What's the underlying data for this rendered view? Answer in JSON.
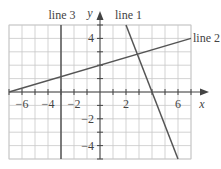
{
  "chart_data": {
    "type": "line",
    "title": "",
    "xlabel": "x",
    "ylabel": "y",
    "xlim": [
      -7,
      7
    ],
    "ylim": [
      -5,
      5
    ],
    "grid": true,
    "grid_step": 1,
    "x_tick_labels": [
      "-6",
      "-4",
      "-2",
      "2",
      "6"
    ],
    "x_tick_values": [
      -6,
      -4,
      -2,
      2,
      6
    ],
    "y_tick_labels": [
      "4",
      "-2",
      "-4"
    ],
    "y_tick_values": [
      4,
      -2,
      -4
    ],
    "series": [
      {
        "name": "line 1",
        "equation": "y = -2.5x + 10",
        "points": [
          [
            2,
            5
          ],
          [
            6,
            -5
          ]
        ]
      },
      {
        "name": "line 2",
        "equation": "y = (2/7)x + 2",
        "points": [
          [
            -7,
            0
          ],
          [
            7,
            4
          ]
        ]
      },
      {
        "name": "line 3",
        "equation": "x = -3",
        "points": [
          [
            -3,
            5
          ],
          [
            -3,
            -5
          ]
        ]
      }
    ],
    "legend_position": "inline labels at line ends"
  },
  "labels": {
    "x_axis": "x",
    "y_axis": "y",
    "line1": "line 1",
    "line2": "line 2",
    "line3": "line 3",
    "tick_x_m6": "−6",
    "tick_x_m4": "−4",
    "tick_x_m2": "−2",
    "tick_x_2": "2",
    "tick_x_6": "6",
    "tick_y_4": "4",
    "tick_y_m2": "−2",
    "tick_y_m4": "−4"
  }
}
